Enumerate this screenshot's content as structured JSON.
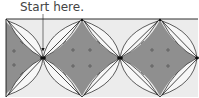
{
  "caption": "Start here.",
  "colors": {
    "background": "#ebebeb",
    "shaded": "#8f8f8f",
    "light": "#f4f4f4",
    "line": "#1a1a1a"
  },
  "diagram": {
    "units": 3,
    "markers": [
      "a",
      "b"
    ]
  }
}
